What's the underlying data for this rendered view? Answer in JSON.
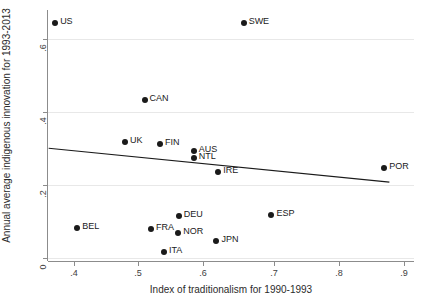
{
  "chart_data": {
    "type": "scatter",
    "title": "",
    "xlabel": "Index of traditionalism for 1990-1993",
    "ylabel": "Annual average indigenous innovation for 1993-2013",
    "xlim": [
      0.355,
      0.92
    ],
    "ylim": [
      -0.015,
      0.695
    ],
    "xticks": [
      0.4,
      0.5,
      0.6,
      0.7,
      0.8,
      0.9
    ],
    "xticklabels": [
      ".4",
      ".5",
      ".6",
      ".7",
      ".8",
      ".9"
    ],
    "yticks": [
      0,
      0.2,
      0.4,
      0.6
    ],
    "yticklabels": [
      "0",
      ".2",
      ".4",
      ".6"
    ],
    "grid": "horizontal",
    "legend": "none",
    "point_labels": [
      "US",
      "SWE",
      "CAN",
      "UK",
      "FIN",
      "AUS",
      "NTL",
      "IRE",
      "POR",
      "DEU",
      "BEL",
      "FRA",
      "NOR",
      "ESP",
      "JPN",
      "ITA"
    ],
    "points": [
      {
        "label": "US",
        "x": 0.366,
        "y": 0.658
      },
      {
        "label": "SWE",
        "x": 0.657,
        "y": 0.658
      },
      {
        "label": "CAN",
        "x": 0.504,
        "y": 0.441
      },
      {
        "label": "UK",
        "x": 0.474,
        "y": 0.323
      },
      {
        "label": "FIN",
        "x": 0.528,
        "y": 0.315
      },
      {
        "label": "AUS",
        "x": 0.58,
        "y": 0.296
      },
      {
        "label": "NTL",
        "x": 0.58,
        "y": 0.277
      },
      {
        "label": "IRE",
        "x": 0.618,
        "y": 0.236
      },
      {
        "label": "POR",
        "x": 0.874,
        "y": 0.247
      },
      {
        "label": "DEU",
        "x": 0.557,
        "y": 0.112
      },
      {
        "label": "BEL",
        "x": 0.4,
        "y": 0.079
      },
      {
        "label": "FRA",
        "x": 0.514,
        "y": 0.076
      },
      {
        "label": "NOR",
        "x": 0.556,
        "y": 0.063
      },
      {
        "label": "ESP",
        "x": 0.7,
        "y": 0.115
      },
      {
        "label": "JPN",
        "x": 0.615,
        "y": 0.041
      },
      {
        "label": "ITA",
        "x": 0.534,
        "y": 0.01
      }
    ],
    "fit_line": {
      "type": "linear",
      "x_start": 0.356,
      "y_start": 0.304,
      "x_end": 0.882,
      "y_end": 0.208
    },
    "colors": {
      "marker": "#1a1a1a",
      "fit_line": "#1a1a1a",
      "grid": "#e8e8e8",
      "axis": "#8c8c8c",
      "text": "#2b2b2b"
    }
  }
}
